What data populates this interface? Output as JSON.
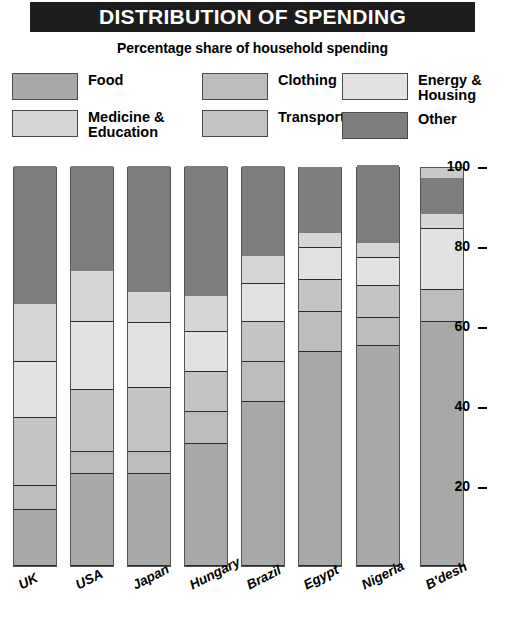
{
  "header": {
    "title": "DISTRIBUTION OF SPENDING",
    "subtitle": "Percentage share of household spending"
  },
  "legend": {
    "columns": [
      [
        {
          "label": "Food",
          "key": "food",
          "color": "#a8a8a8"
        },
        {
          "label": "Medicine &\nEducation",
          "key": "medicine_education",
          "color": "#d6d6d6"
        }
      ],
      [
        {
          "label": "Clothing",
          "key": "clothing",
          "color": "#bdbdbd"
        },
        {
          "label": "Transport",
          "key": "transport",
          "color": "#c4c4c4"
        }
      ],
      [
        {
          "label": "Energy &\nHousing",
          "key": "energy_housing",
          "color": "#e2e2e2"
        },
        {
          "label": "Other",
          "key": "other",
          "color": "#7d7d7d"
        }
      ]
    ]
  },
  "chart_data": {
    "type": "bar",
    "subtype": "stacked-vertical-100",
    "title": "DISTRIBUTION OF SPENDING",
    "subtitle": "Percentage share of household spending",
    "xlabel": "",
    "ylabel": "",
    "ylim": [
      0,
      100
    ],
    "yticks": [
      20,
      40,
      60,
      80,
      100
    ],
    "grid": false,
    "legend_position": "top",
    "categories": [
      "UK",
      "USA",
      "Japan",
      "Hungary",
      "Brazil",
      "Egypt",
      "Nigeria",
      "B'desh"
    ],
    "series": [
      {
        "name": "Food",
        "key": "food",
        "color": "#a8a8a8",
        "values": [
          14,
          23,
          23,
          30.5,
          41,
          53.5,
          55,
          61
        ]
      },
      {
        "name": "Clothing",
        "key": "clothing",
        "color": "#bdbdbd",
        "values": [
          6,
          5.5,
          5.5,
          8,
          10,
          10,
          7,
          8
        ]
      },
      {
        "name": "Transport",
        "key": "transport",
        "color": "#c4c4c4",
        "values": [
          17,
          15.5,
          16,
          10,
          10,
          8,
          8,
          0
        ]
      },
      {
        "name": "Energy & Housing",
        "key": "energy_housing",
        "color": "#e2e2e2",
        "values": [
          14,
          17,
          16.25,
          10,
          9.5,
          8,
          7,
          15.25
        ]
      },
      {
        "name": "Medicine & Education",
        "key": "medicine_education",
        "color": "#d6d6d6",
        "values": [
          14.5,
          12.75,
          7.75,
          9,
          7,
          3.75,
          3.75,
          3.75
        ]
      },
      {
        "name": "Other",
        "key": "other",
        "color": "#7d7d7d",
        "values": [
          34.5,
          26.25,
          31.5,
          32.5,
          22.5,
          16.5,
          19.5,
          9
        ]
      }
    ],
    "stack_order_bottom_to_top": [
      "food",
      "clothing",
      "transport",
      "energy_housing",
      "medicine_education",
      "other"
    ],
    "boundaries_bottom_to_top": {
      "UK": [
        14,
        20,
        37,
        51,
        65.5,
        100
      ],
      "USA": [
        23,
        28.5,
        44,
        61,
        73.75,
        100
      ],
      "Japan": [
        23,
        28.5,
        44.75,
        61,
        68.75,
        100
      ],
      "Hungary": [
        30.5,
        38.5,
        48.75,
        58.75,
        67.5,
        100
      ],
      "Brazil": [
        41,
        51,
        61,
        70.5,
        77.5,
        100
      ],
      "Egypt": [
        53.5,
        63.75,
        71.75,
        79.75,
        83.5,
        100
      ],
      "Nigeria": [
        55,
        61.75,
        69.75,
        76.75,
        80.5,
        100
      ],
      "B'desh": [
        61,
        69.25,
        69.25,
        84.5,
        88.25,
        100
      ]
    }
  },
  "axis": {
    "ticks": [
      "100",
      "80",
      "60",
      "40",
      "20"
    ],
    "tick_values": [
      100,
      80,
      60,
      40,
      20
    ]
  }
}
